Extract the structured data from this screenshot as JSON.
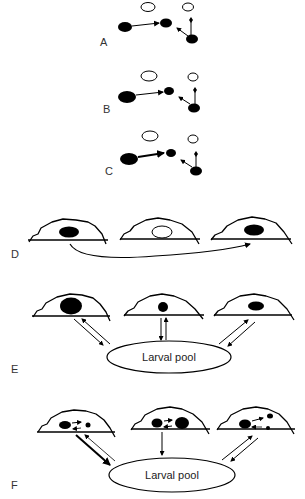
{
  "figure": {
    "panels": [
      {
        "id": "A",
        "label": "A",
        "type": "node-network",
        "arrow_weight": "normal"
      },
      {
        "id": "B",
        "label": "B",
        "type": "node-network",
        "arrow_weight": "normal",
        "note": "larger source node"
      },
      {
        "id": "C",
        "label": "C",
        "type": "node-network",
        "arrow_weight": "bold",
        "note": "larger source node, thicker arrow"
      },
      {
        "id": "D",
        "label": "D",
        "type": "three-cells",
        "cells": [
          "filled nucleus",
          "open nucleus",
          "filled nucleus"
        ],
        "connection": "curved arrow from first to third cell"
      },
      {
        "id": "E",
        "label": "E",
        "type": "cells-with-pool",
        "pool_label": "Larval pool",
        "connections": [
          "bidirectional",
          "bidirectional",
          "bidirectional"
        ]
      },
      {
        "id": "F",
        "label": "F",
        "type": "cells-with-pool",
        "pool_label": "Larval pool",
        "connections": [
          "bidirectional (bold out)",
          "one-way to pool",
          "bidirectional"
        ]
      }
    ]
  },
  "colors": {
    "stroke": "#000000",
    "fill": "#000000",
    "background": "#ffffff",
    "label": "#333333"
  }
}
